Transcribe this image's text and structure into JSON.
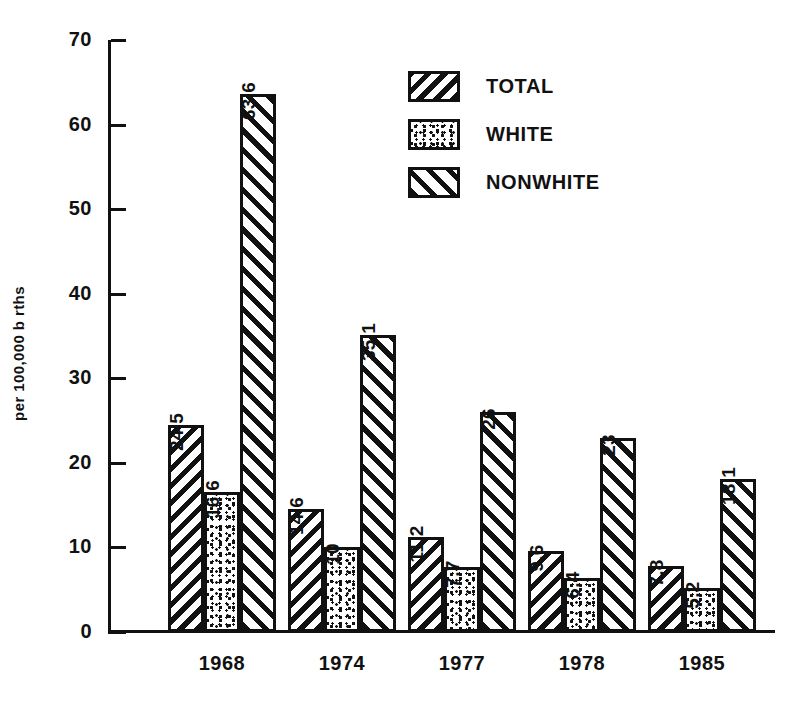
{
  "chart_data": {
    "type": "bar",
    "title": "",
    "xlabel": "",
    "ylabel": "per 100,000 b rths",
    "ylim": [
      0,
      70
    ],
    "ytick_labels": [
      "70",
      "60",
      "50",
      "40",
      "30",
      "20",
      "10",
      "0"
    ],
    "ytick_values": [
      70,
      60,
      50,
      40,
      30,
      20,
      10,
      0
    ],
    "grid": false,
    "legend_position": "top-center-right",
    "categories": [
      "1968",
      "1974",
      "1977",
      "1978",
      "1985"
    ],
    "series": [
      {
        "name": "TOTAL",
        "pattern": "diagonal-hatch-down-right",
        "values": [
          24.5,
          14.6,
          11.2,
          9.6,
          7.8
        ],
        "labels": [
          "24.5",
          "14.6",
          "11.2",
          "9.6",
          "7.8"
        ]
      },
      {
        "name": "WHITE",
        "pattern": "speckle",
        "values": [
          16.6,
          10,
          7.7,
          6.4,
          5.2
        ],
        "labels": [
          "16.6",
          "10",
          "7.7",
          "6.4",
          "5.2"
        ]
      },
      {
        "name": "NONWHITE",
        "pattern": "diagonal-hatch-up-right",
        "values": [
          63.6,
          35.1,
          26,
          23,
          18.1
        ],
        "labels": [
          "63.6",
          "35.1",
          "26",
          "23",
          "18.1"
        ]
      }
    ],
    "colors": {
      "ink": "#111111",
      "background": "#ffffff"
    }
  }
}
